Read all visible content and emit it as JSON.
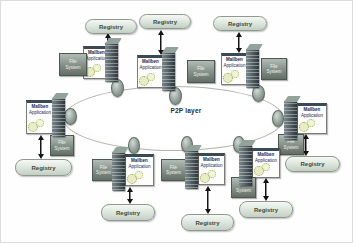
{
  "diagram": {
    "type": "p2p-architecture-diagram",
    "title": "P2P layer",
    "labels": {
      "p2p_layer": "P2P layer",
      "registry": "Registry",
      "application_line1": "Mallben",
      "application_line2": "Application",
      "file_system_line1": "File",
      "file_system_line2": "System"
    },
    "counts": {
      "registries": 8,
      "peer_nodes": 8,
      "servers": 8,
      "application_boxes": 8,
      "file_system_boxes": 8
    },
    "clusters": [
      {
        "id": "top-left"
      },
      {
        "id": "top-center"
      },
      {
        "id": "top-right"
      },
      {
        "id": "right"
      },
      {
        "id": "bottom-right"
      },
      {
        "id": "bottom-center"
      },
      {
        "id": "bottom-center-left"
      },
      {
        "id": "left"
      }
    ],
    "colors": {
      "registry_fill": "#dfe8df",
      "registry_border": "#8f998f",
      "app_header_bar": "#3a4a52",
      "app_text": "#1c2a56",
      "file_box_fill": "#848e88",
      "server_fill": "#44545a",
      "peer_fill": "#93a09a",
      "arrow": "#141414",
      "ellipse_border": "#b2b2ae",
      "gears": "#98a645"
    }
  }
}
